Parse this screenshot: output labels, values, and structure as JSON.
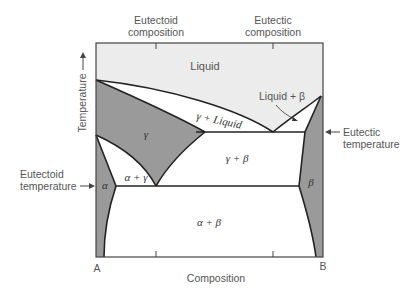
{
  "diagram": {
    "type": "binary phase diagram with eutectic and eutectoid",
    "top_labels": {
      "eutectoid_composition": [
        "Eutectoid",
        "composition"
      ],
      "eutectic_composition": [
        "Eutectic",
        "composition"
      ]
    },
    "axis": {
      "y_label": "Temperature",
      "x_label": "Composition",
      "left_end": "A",
      "right_end": "B"
    },
    "side_labels": {
      "eutectic_temperature": [
        "Eutectic",
        "temperature"
      ],
      "eutectoid_temperature": [
        "Eutectoid",
        "temperature"
      ]
    },
    "regions": {
      "liquid": "Liquid",
      "gamma": "γ",
      "gamma_liquid": "γ + Liquid",
      "liquid_beta": "Liquid + β",
      "gamma_beta": "γ + β",
      "alpha_gamma": "α + γ",
      "alpha": "α",
      "beta": "β",
      "alpha_beta": "α + β"
    },
    "colors": {
      "liquid_fill": "#ececec",
      "solid_fill": "#9a9a9a",
      "line": "#222222",
      "background": "#ffffff"
    }
  }
}
